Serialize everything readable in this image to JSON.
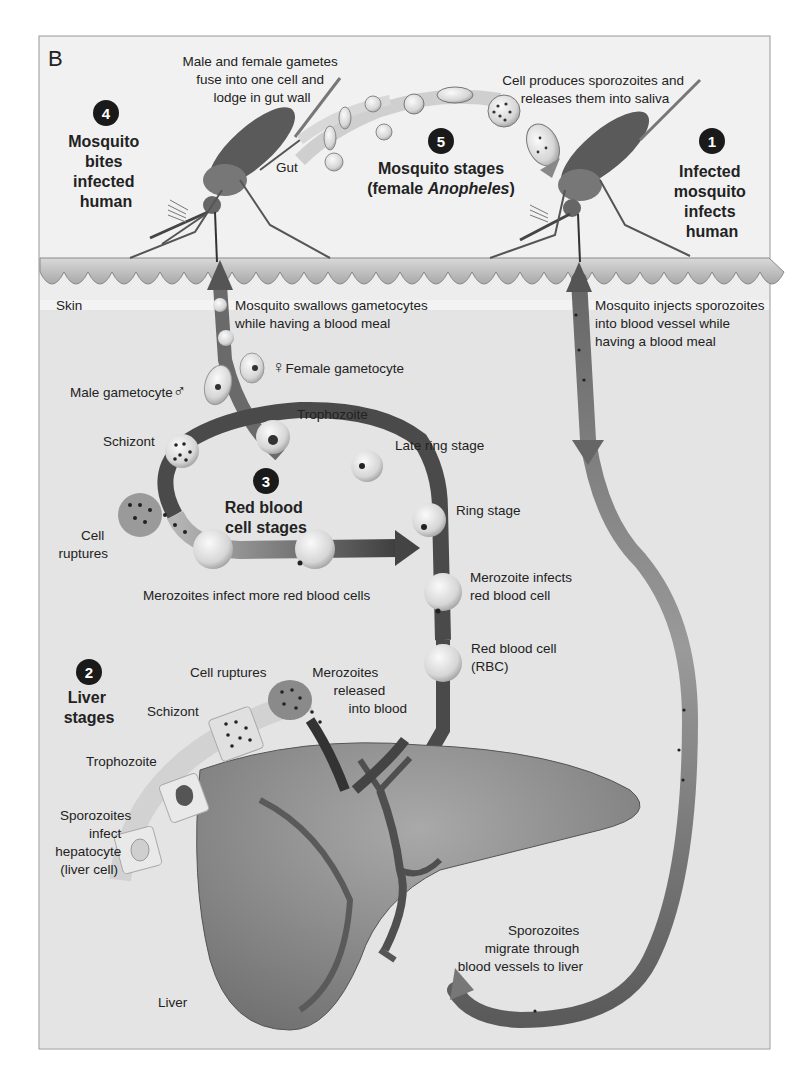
{
  "figure": {
    "panel_label": "B",
    "colors": {
      "background": "#ededed",
      "frame": "#9a9a9a",
      "skin_band": "#c8c8c8",
      "skin_light": "#dcdcdc",
      "track_dark": "#444444",
      "track_mid": "#8a8a8a",
      "cell": "#e6e6e6",
      "badge": "#1a1a1a",
      "liver": "#8c8c8c"
    }
  },
  "stages": [
    {
      "number": "1",
      "title_lines": [
        "Infected",
        "mosquito",
        "infects",
        "human"
      ]
    },
    {
      "number": "2",
      "title_lines": [
        "Liver",
        "stages"
      ]
    },
    {
      "number": "3",
      "title_lines": [
        "Red blood",
        "cell stages"
      ]
    },
    {
      "number": "4",
      "title_lines": [
        "Mosquito",
        "bites",
        "infected",
        "human"
      ]
    },
    {
      "number": "5",
      "title_lines": [
        "Mosquito stages",
        "(female ",
        "Anopheles",
        ")"
      ]
    }
  ],
  "mosquito_labels": {
    "gametes_fuse": [
      "Male and female gametes",
      "fuse into one cell and",
      "lodge in gut wall"
    ],
    "gut": "Gut",
    "sporozoite_release": [
      "Cell produces sporozoites and",
      "releases them into saliva"
    ]
  },
  "skin_labels": {
    "skin": "Skin",
    "swallows": [
      "Mosquito swallows gametocytes",
      "while having a blood meal"
    ],
    "injects": [
      "Mosquito injects sporozoites",
      "into blood vessel while",
      "having a blood meal"
    ]
  },
  "blood_labels": {
    "female_gametocyte": "Female gametocyte",
    "female_symbol": "♀",
    "male_gametocyte": "Male gametocyte",
    "male_symbol": "♂",
    "trophozoite": "Trophozoite",
    "schizont": "Schizont",
    "late_ring": "Late ring stage",
    "ring": "Ring stage",
    "cell_ruptures": [
      "Cell",
      "ruptures"
    ],
    "merozoites_infect_more": "Merozoites infect more red blood cells",
    "merozoite_infects_rbc": [
      "Merozoite infects",
      "red blood cell"
    ],
    "rbc": [
      "Red blood cell",
      "(RBC)"
    ]
  },
  "liver_labels": {
    "cell_ruptures": "Cell ruptures",
    "merozoites_released": [
      "Merozoites",
      "released",
      "into blood"
    ],
    "schizont": "Schizont",
    "trophozoite": "Trophozoite",
    "sporozoites_infect": [
      "Sporozoites",
      "infect",
      "hepatocyte",
      "(liver cell)"
    ],
    "liver": "Liver",
    "sporozoites_migrate": [
      "Sporozoites",
      "migrate through",
      "blood vessels to liver"
    ]
  }
}
